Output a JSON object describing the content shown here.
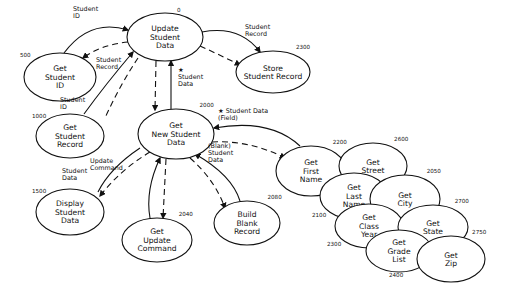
{
  "diagram": {
    "title": "",
    "nodes": [
      {
        "id": "update_student_data",
        "lines": [
          "Update",
          "Student",
          "Data"
        ],
        "number": "0",
        "cx": 165,
        "cy": 37,
        "rx": 38,
        "ry": 24
      },
      {
        "id": "get_student_id",
        "lines": [
          "Get",
          "Student",
          "ID"
        ],
        "number": "500",
        "cx": 60,
        "cy": 77,
        "rx": 36,
        "ry": 24
      },
      {
        "id": "store_student_record",
        "lines": [
          "Store",
          "Student Record"
        ],
        "number": "2300",
        "cx": 273,
        "cy": 72,
        "rx": 37,
        "ry": 21
      },
      {
        "id": "get_student_record",
        "lines": [
          "Get",
          "Student",
          "Record"
        ],
        "number": "1000",
        "cx": 70,
        "cy": 136,
        "rx": 34,
        "ry": 22
      },
      {
        "id": "get_new_student_data",
        "lines": [
          "Get",
          "New Student",
          "Data"
        ],
        "number": "2000",
        "cx": 176,
        "cy": 134,
        "rx": 38,
        "ry": 25
      },
      {
        "id": "display_student_data",
        "lines": [
          "Display",
          "Student",
          "Data"
        ],
        "number": "1500",
        "cx": 70,
        "cy": 212,
        "rx": 34,
        "ry": 23
      },
      {
        "id": "get_update_command",
        "lines": [
          "Get",
          "Update",
          "Command"
        ],
        "number": "2040",
        "cx": 157,
        "cy": 240,
        "rx": 35,
        "ry": 22
      },
      {
        "id": "build_blank_record",
        "lines": [
          "Build",
          "Blank",
          "Record"
        ],
        "number": "2080",
        "cx": 247,
        "cy": 223,
        "rx": 33,
        "ry": 22
      },
      {
        "id": "get_first_name",
        "lines": [
          "Get",
          "First",
          "Name"
        ],
        "number": "2200",
        "cx": 311,
        "cy": 171,
        "rx": 35,
        "ry": 25
      },
      {
        "id": "get_street",
        "lines": [
          "Get",
          "Street"
        ],
        "number": "2600",
        "cx": 373,
        "cy": 166,
        "rx": 34,
        "ry": 23
      },
      {
        "id": "get_last_name",
        "lines": [
          "Get",
          "Last",
          "Name"
        ],
        "number": "2100",
        "cx": 354,
        "cy": 196,
        "rx": 34,
        "ry": 23
      },
      {
        "id": "get_city",
        "lines": [
          "Get",
          "City"
        ],
        "number": "2050",
        "cx": 405,
        "cy": 199,
        "rx": 35,
        "ry": 24
      },
      {
        "id": "get_class_year",
        "lines": [
          "Get",
          "Class",
          "Year"
        ],
        "number": "2300",
        "cx": 369,
        "cy": 226,
        "rx": 34,
        "ry": 22
      },
      {
        "id": "get_state",
        "lines": [
          "Get",
          "State"
        ],
        "number": "2700",
        "cx": 433,
        "cy": 227,
        "rx": 35,
        "ry": 22
      },
      {
        "id": "get_grade_list",
        "lines": [
          "Get",
          "Grade",
          "List"
        ],
        "number": "2400",
        "cx": 399,
        "cy": 251,
        "rx": 33,
        "ry": 21
      },
      {
        "id": "get_zip",
        "lines": [
          "Get",
          "Zip"
        ],
        "number": "2750",
        "cx": 451,
        "cy": 259,
        "rx": 34,
        "ry": 23
      }
    ],
    "flow_labels": [
      {
        "id": "student_id_top",
        "lines": [
          "Student",
          "ID"
        ],
        "x": 73,
        "y": 11
      },
      {
        "id": "student_record_left",
        "lines": [
          "Student",
          "Record"
        ],
        "x": 96,
        "y": 62
      },
      {
        "id": "student_record_right",
        "lines": [
          "Student",
          "Record"
        ],
        "x": 245,
        "y": 29
      },
      {
        "id": "student_data_mid",
        "lines": [
          "★",
          "Student",
          "Data"
        ],
        "x": 178,
        "y": 72
      },
      {
        "id": "student_id_lower",
        "lines": [
          "Student",
          "ID"
        ],
        "x": 60,
        "y": 102
      },
      {
        "id": "student_data_field",
        "lines": [
          "★ Student Data",
          "(Field)"
        ],
        "x": 218,
        "y": 113
      },
      {
        "id": "update_command",
        "lines": [
          "Update",
          "Command"
        ],
        "x": 90,
        "y": 163
      },
      {
        "id": "blank_student_data",
        "lines": [
          "(Blank)",
          "Student",
          "Data"
        ],
        "x": 208,
        "y": 148
      },
      {
        "id": "student_data_left",
        "lines": [
          "Student",
          "Data"
        ],
        "x": 62,
        "y": 173
      }
    ],
    "flows": [
      {
        "id": "f1",
        "style": "solid",
        "d": "M 64 53 Q 90 18 128 30",
        "arrow_end": true
      },
      {
        "id": "f2",
        "style": "dashed",
        "d": "M 128 42 Q 100 45 83 58",
        "arrow_end": true
      },
      {
        "id": "f3",
        "style": "solid",
        "d": "M 202 32 Q 240 25 260 52",
        "arrow_end": true
      },
      {
        "id": "f4",
        "style": "dashed",
        "d": "M 200 46 Q 220 55 240 65",
        "arrow_end": true
      },
      {
        "id": "f5",
        "style": "solid",
        "d": "M 84 114 Q 105 85 133 52",
        "arrow_end": true
      },
      {
        "id": "f6",
        "style": "dashed",
        "d": "M 138 58 Q 120 85 105 118",
        "arrow_end": false
      },
      {
        "id": "f7",
        "style": "dashed",
        "d": "M 156 61 L 155 110",
        "arrow_end": true
      },
      {
        "id": "f8",
        "style": "solid",
        "d": "M 171 109 L 171 61",
        "arrow_end": true
      },
      {
        "id": "f9",
        "style": "solid",
        "d": "M 300 146 Q 270 118 214 128",
        "arrow_end": true
      },
      {
        "id": "f10",
        "style": "dashed",
        "d": "M 212 142 Q 250 140 285 158",
        "arrow_end": true
      },
      {
        "id": "f11",
        "style": "solid",
        "d": "M 98 192 Q 110 168 140 148",
        "arrow_end": false
      },
      {
        "id": "f12",
        "style": "dashed",
        "d": "M 150 152 Q 120 170 100 196",
        "arrow_end": true
      },
      {
        "id": "f13",
        "style": "solid",
        "d": "M 150 218 Q 145 190 160 158",
        "arrow_end": true
      },
      {
        "id": "f14",
        "style": "dashed",
        "d": "M 166 159 L 163 218",
        "arrow_end": true
      },
      {
        "id": "f15",
        "style": "solid",
        "d": "M 240 201 Q 232 175 195 154",
        "arrow_end": true
      },
      {
        "id": "f16",
        "style": "dashed",
        "d": "M 190 158 Q 215 180 225 208",
        "arrow_end": true
      },
      {
        "id": "f17",
        "style": "solid",
        "d": "M 84 189 L 84 189",
        "arrow_end": false
      }
    ],
    "marks": [
      {
        "id": "star_top",
        "text": "°",
        "x": 207,
        "y": 14
      }
    ]
  }
}
